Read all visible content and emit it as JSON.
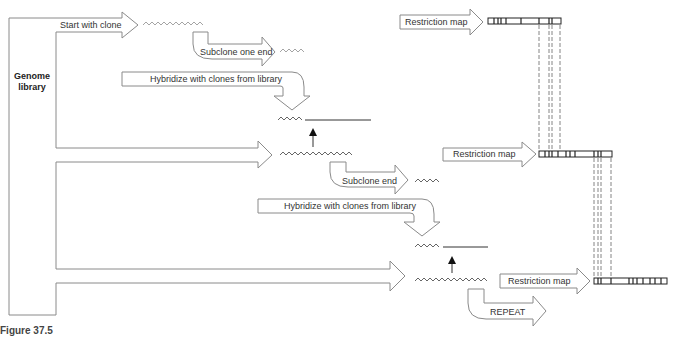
{
  "diagram": {
    "source_label": "Genome library",
    "source_label_lines": [
      "Genome",
      "library"
    ],
    "steps": {
      "start": "Start with clone",
      "subclone_one_end": "Subclone one end",
      "hybridize_1": "Hybridize with clones from library",
      "restriction_map_1": "Restriction map",
      "subclone_end": "Subclone end",
      "hybridize_2": "Hybridize with clones from library",
      "restriction_map_2": "Restriction map",
      "restriction_map_3": "Restriction map",
      "repeat": "REPEAT"
    },
    "caption": "Figure 37.5",
    "colors": {
      "arrow_outline": "#8a8a8a",
      "dna_line": "#333333",
      "map_outline": "#222222"
    }
  }
}
